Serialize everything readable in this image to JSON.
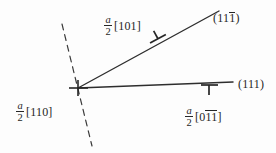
{
  "figure": {
    "background_color": "#fdfdfd",
    "ink_color": "#262626"
  },
  "labels": {
    "upper_burgers": {
      "fraction_numerator": "a",
      "fraction_denominator": "2",
      "index_open": "[",
      "index_digits": "101",
      "index_close": "]",
      "full_text": "a/2 [101]"
    },
    "left_burgers": {
      "fraction_numerator": "a",
      "fraction_denominator": "2",
      "index_open": "[",
      "index_digits": "110",
      "index_close": "]",
      "full_text": "a/2 [110]"
    },
    "lower_burgers": {
      "fraction_numerator": "a",
      "fraction_denominator": "2",
      "index_open": "[",
      "index_digit_first": "0",
      "index_digits_barred": "11",
      "index_close": "]",
      "full_text": "a/2 [011bar1bar]"
    },
    "plane_upper": {
      "open": "(",
      "digits_plain": "11",
      "digit_barred": "1",
      "close": ")",
      "full_text": "(111bar)"
    },
    "plane_lower": {
      "open": "(",
      "digits_plain": "111",
      "close": ")",
      "full_text": "(111)"
    }
  },
  "geometry": {
    "node": {
      "x": 78,
      "y": 88
    },
    "inclined_line": {
      "x1": 78,
      "y1": 88,
      "x2": 219,
      "y2": 11
    },
    "horizontal_line": {
      "x1": 78,
      "y1": 88,
      "x2": 233,
      "y2": 82
    },
    "dashed_line": {
      "x1": 62,
      "y1": 24,
      "x2": 92,
      "y2": 146
    }
  },
  "symbols": {
    "node_dislocation": {
      "name": "dislocation-perpendicular",
      "x": 78,
      "y": 88
    },
    "inclined_dislocation": {
      "name": "dislocation-perpendicular",
      "x": 157,
      "y": 37
    },
    "horizontal_dislocation": {
      "name": "dislocation-perpendicular",
      "x": 209,
      "y": 89
    }
  }
}
